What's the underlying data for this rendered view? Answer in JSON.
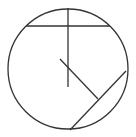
{
  "diagram": {
    "type": "geometry-circle",
    "stroke_color": "#333333",
    "background": "#ffffff",
    "circle": {
      "cx": 68,
      "cy": 69,
      "r": 60
    },
    "segments": [
      {
        "name": "vertical-radius-line",
        "x1": 68,
        "y1": 8,
        "x2": 68,
        "y2": 87
      },
      {
        "name": "horizontal-chord",
        "x1": 26,
        "y1": 26,
        "x2": 110,
        "y2": 26
      },
      {
        "name": "diagonal-segment",
        "x1": 60,
        "y1": 59,
        "x2": 98,
        "y2": 99
      },
      {
        "name": "lower-right-chord",
        "x1": 126,
        "y1": 71,
        "x2": 70,
        "y2": 130
      }
    ]
  }
}
